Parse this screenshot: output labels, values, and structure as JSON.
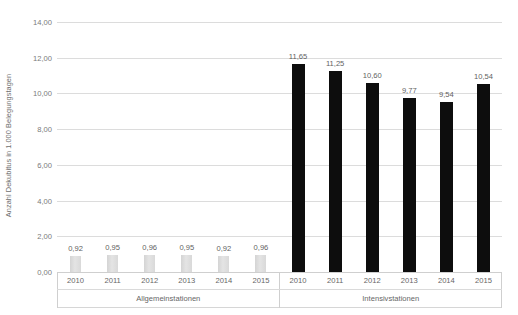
{
  "chart_data": {
    "type": "bar",
    "title": "",
    "xlabel": "",
    "ylabel": "Anzahl Dekubitus in 1.000 Belegungstagen",
    "ylim": [
      0,
      14
    ],
    "ytick_labels": [
      "0,00",
      "2,00",
      "4,00",
      "6,00",
      "8,00",
      "10,00",
      "12,00",
      "14,00"
    ],
    "ytick_values": [
      0,
      2,
      4,
      6,
      8,
      10,
      12,
      14
    ],
    "grid": true,
    "legend": "none",
    "decimal_separator": ",",
    "categories": [
      "2010",
      "2011",
      "2012",
      "2013",
      "2014",
      "2015"
    ],
    "groups": [
      {
        "name": "Allgemeinstationen",
        "color": "#dcdcdc",
        "values": [
          0.92,
          0.95,
          0.96,
          0.95,
          0.92,
          0.96
        ],
        "value_labels": [
          "0,92",
          "0,95",
          "0,96",
          "0,95",
          "0,92",
          "0,96"
        ],
        "categories": [
          "2010",
          "2011",
          "2012",
          "2013",
          "2014",
          "2015"
        ]
      },
      {
        "name": "Intensivstationen",
        "color": "#0d0d0d",
        "values": [
          11.65,
          11.25,
          10.6,
          9.77,
          9.54,
          10.54
        ],
        "value_labels": [
          "11,65",
          "11,25",
          "10,60",
          "9,77",
          "9,54",
          "10,54"
        ],
        "categories": [
          "2010",
          "2011",
          "2012",
          "2013",
          "2014",
          "2015"
        ]
      }
    ]
  }
}
